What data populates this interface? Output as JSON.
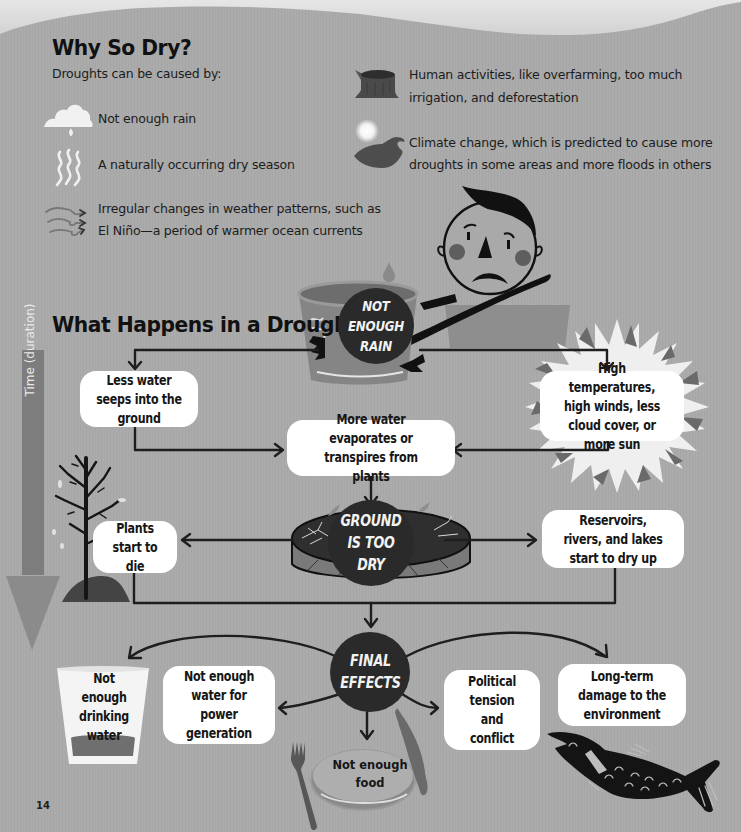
{
  "page": {
    "page_number": "14",
    "background_color": "#a9a9a9"
  },
  "why_so_dry": {
    "title": "Why So Dry?",
    "intro": "Droughts can be caused by:",
    "causes": [
      {
        "icon": "cloud-icon",
        "text_line1": "Not enough rain",
        "text_line2": ""
      },
      {
        "icon": "heat-waves-icon",
        "text_line1": "A naturally occurring dry season",
        "text_line2": ""
      },
      {
        "icon": "wind-icon",
        "text_line1": "Irregular changes in weather patterns, such as",
        "text_line2": "El Niño—a period of warmer ocean currents"
      },
      {
        "icon": "tree-stump-icon",
        "text_line1": "Human activities, like overfarming, too much",
        "text_line2": "irrigation, and deforestation"
      },
      {
        "icon": "sun-and-wave-icon",
        "text_line1": "Climate change, which is predicted to cause more",
        "text_line2": "droughts in some areas and more floods in others"
      }
    ]
  },
  "what_happens": {
    "title": "What Happens in a Drought?",
    "time_axis_label": "Time (duration)",
    "nodes": {
      "not_enough_rain": "NOT\nENOUGH\nRAIN",
      "less_water_seeps": "Less water seeps into the ground",
      "high_temperatures": "High temperatures, high winds, less cloud cover, or more sun",
      "more_water_evaporates": "More water evaporates or transpires from plants",
      "ground_too_dry": "GROUND\nIS TOO\nDRY",
      "plants_die": "Plants start to die",
      "reservoirs_dry": "Reservoirs, rivers, and lakes start to dry up",
      "final_effects": "FINAL\nEFFECTS",
      "drinking_water": "Not enough drinking water",
      "power_generation": "Not enough water for power generation",
      "food": "Not enough food",
      "political": "Political tension and conflict",
      "environment": "Long-term damage to the environment"
    }
  }
}
